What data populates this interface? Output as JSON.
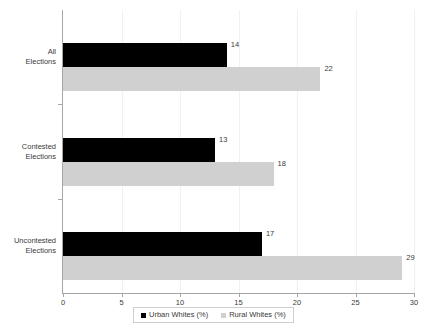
{
  "chart_data": {
    "type": "bar",
    "orientation": "horizontal",
    "title": "",
    "xlabel": "",
    "ylabel": "",
    "categories": [
      "All\nElections",
      "Contested\nElections",
      "Uncontested\nElections"
    ],
    "category_lines": [
      [
        "All",
        "Elections"
      ],
      [
        "Contested",
        "Elections"
      ],
      [
        "Uncontested",
        "Elections"
      ]
    ],
    "series": [
      {
        "name": "Urban Whites (%)",
        "color": "#000000",
        "values": [
          14,
          13,
          17
        ]
      },
      {
        "name": "Rural Whites (%)",
        "color": "#d0d0d0",
        "values": [
          22,
          18,
          29
        ]
      }
    ],
    "xlim": [
      0,
      30
    ],
    "xticks": [
      0,
      5,
      10,
      15,
      20,
      25,
      30
    ],
    "xtick_labels": [
      "0",
      "5",
      "10",
      "15",
      "20",
      "25",
      "30"
    ],
    "grid": true,
    "grid_axis": "x",
    "data_labels": [
      [
        "14",
        "22"
      ],
      [
        "13",
        "18"
      ],
      [
        "17",
        "29"
      ]
    ],
    "legend_position": "bottom"
  },
  "legend": {
    "entries": [
      {
        "label": "Urban Whites (%)"
      },
      {
        "label": "Rural Whites (%)"
      }
    ]
  }
}
